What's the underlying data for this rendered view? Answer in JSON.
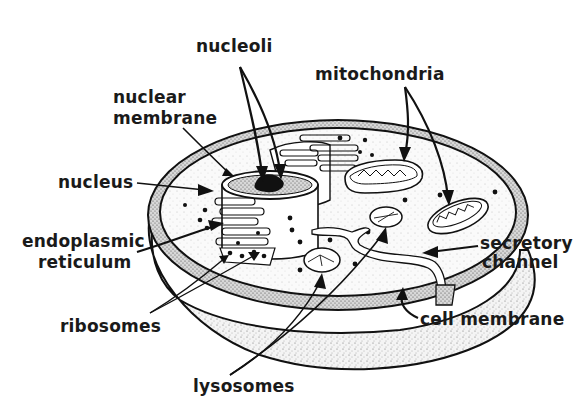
{
  "diagram": {
    "background_color": "#ffffff",
    "ink_color": "#111111",
    "labels": {
      "nucleoli": "nucleoli",
      "nuclear_membrane_1": "nuclear",
      "nuclear_membrane_2": "membrane",
      "mitochondria": "mitochondria",
      "nucleus": "nucleus",
      "endoplasmic_reticulum_1": "endoplasmic",
      "endoplasmic_reticulum_2": "reticulum",
      "secretory_channel_1": "secretory",
      "secretory_channel_2": "channel",
      "ribosomes": "ribosomes",
      "cell_membrane": "cell membrane",
      "lysosomes": "lysosomes"
    }
  }
}
